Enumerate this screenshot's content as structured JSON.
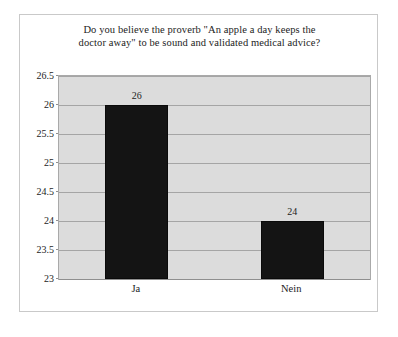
{
  "chart_data": {
    "type": "bar",
    "title": "Do you believe the proverb \"An apple a day keeps the doctor away\" to be sound and validated medical advice?",
    "title_lines": [
      "Do you believe the proverb \"An apple a day keeps the",
      "doctor away\" to be sound and validated medical advice?"
    ],
    "categories": [
      "Ja",
      "Nein"
    ],
    "values": [
      26,
      24
    ],
    "data_labels": [
      "26",
      "24"
    ],
    "xlabel": "",
    "ylabel": "",
    "ylim": [
      23,
      26.5
    ],
    "ytick_labels": [
      "26.5",
      "26",
      "25.5",
      "25",
      "24.5",
      "24",
      "23.5",
      "23"
    ],
    "ytick_values": [
      26.5,
      26,
      25.5,
      25,
      24.5,
      24,
      23.5,
      23
    ],
    "grid": true,
    "legend": false,
    "legend_position": "none",
    "colors": {
      "bar": "#141414",
      "plot_background": "#dcdcdc",
      "gridline": "#a5a5a5",
      "figure_background": "#ffffff",
      "figure_border": "#c9c9c9",
      "text": "#1c1c1c"
    }
  }
}
